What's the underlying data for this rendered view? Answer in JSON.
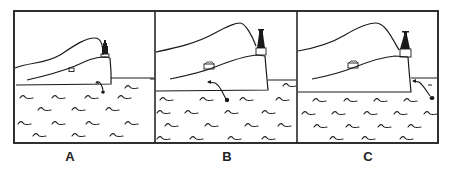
{
  "figure": {
    "type": "three-panel line drawing",
    "stroke_color": "#1a1a1a",
    "background_color": "#ffffff"
  },
  "panels": [
    {
      "label": "A",
      "description": "Object in the water just below the foot of the cliff, near the lighthouse point"
    },
    {
      "label": "B",
      "description": "Object in the water further left, in front of the headland"
    },
    {
      "label": "C",
      "description": "Object in the water to the right, beyond the tip of the headland"
    }
  ]
}
